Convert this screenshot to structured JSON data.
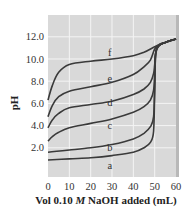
{
  "chart_data": {
    "type": "line",
    "title": "",
    "xlabel": "Vol 0.10 M NaOH added (mL)",
    "xlabel_parts": [
      "Vol 0.10 ",
      "M",
      " NaOH added (mL)"
    ],
    "ylabel": "pH",
    "xlim": [
      0,
      60
    ],
    "ylim": [
      0,
      13.5
    ],
    "xticks": [
      0,
      10,
      20,
      30,
      40,
      50,
      60
    ],
    "xtick_labels": [
      "0",
      "10",
      "20",
      "30",
      "40",
      "50",
      "60"
    ],
    "yticks": [
      2,
      4,
      6,
      8,
      10,
      12
    ],
    "ytick_labels": [
      "2.0",
      "4.0",
      "6.0",
      "8.0",
      "10.0",
      "12.0"
    ],
    "grid": true,
    "legend": "inline curve labels",
    "series": [
      {
        "name": "a",
        "x": [
          0,
          10,
          20,
          30,
          40,
          45,
          48,
          49.5,
          50,
          50.5,
          52,
          55,
          60
        ],
        "y": [
          0.9,
          1.0,
          1.1,
          1.3,
          1.6,
          2.0,
          2.5,
          3.5,
          7.0,
          10.5,
          11.2,
          11.5,
          11.8
        ]
      },
      {
        "name": "b",
        "x": [
          0,
          10,
          20,
          30,
          40,
          45,
          48,
          49.5,
          50,
          50.5,
          52,
          55,
          60
        ],
        "y": [
          1.6,
          1.8,
          2.0,
          2.3,
          2.8,
          3.3,
          3.9,
          4.8,
          7.5,
          10.5,
          11.2,
          11.5,
          11.8
        ]
      },
      {
        "name": "c",
        "x": [
          0,
          2,
          5,
          10,
          20,
          30,
          40,
          45,
          48,
          49.5,
          50,
          50.5,
          52,
          55,
          60
        ],
        "y": [
          2.6,
          3.0,
          3.4,
          3.8,
          4.2,
          4.6,
          5.2,
          5.7,
          6.3,
          7.2,
          8.7,
          10.5,
          11.2,
          11.5,
          11.8
        ]
      },
      {
        "name": "d",
        "x": [
          0,
          2,
          5,
          10,
          20,
          30,
          40,
          45,
          48,
          49.5,
          50,
          50.5,
          52,
          55,
          60
        ],
        "y": [
          3.8,
          4.5,
          5.1,
          5.6,
          5.9,
          6.2,
          6.8,
          7.3,
          7.9,
          8.7,
          9.5,
          10.6,
          11.2,
          11.5,
          11.8
        ]
      },
      {
        "name": "e",
        "x": [
          0,
          2,
          5,
          10,
          20,
          30,
          40,
          45,
          48,
          50,
          52,
          55,
          60
        ],
        "y": [
          4.8,
          5.8,
          6.6,
          7.1,
          7.5,
          7.9,
          8.6,
          9.3,
          9.9,
          10.9,
          11.3,
          11.5,
          11.8
        ]
      },
      {
        "name": "f",
        "x": [
          0,
          2,
          5,
          10,
          20,
          30,
          40,
          45,
          50,
          53,
          55,
          60
        ],
        "y": [
          6.3,
          7.6,
          8.8,
          9.5,
          9.8,
          10.0,
          10.3,
          10.6,
          11.1,
          11.35,
          11.5,
          11.8
        ]
      }
    ],
    "curve_labels": [
      {
        "text": "a",
        "x": 29,
        "y": 0.4
      },
      {
        "text": "b",
        "x": 29,
        "y": 2.0
      },
      {
        "text": "c",
        "x": 29,
        "y": 4.0
      },
      {
        "text": "d",
        "x": 29,
        "y": 6.0
      },
      {
        "text": "e",
        "x": 29,
        "y": 8.2
      },
      {
        "text": "f",
        "x": 29,
        "y": 10.5
      }
    ]
  }
}
